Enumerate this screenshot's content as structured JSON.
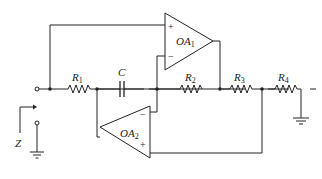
{
  "diagram": {
    "type": "circuit-schematic",
    "components": {
      "R1": {
        "name": "R",
        "sub": "1"
      },
      "C": {
        "name": "C"
      },
      "R2": {
        "name": "R",
        "sub": "2"
      },
      "R3": {
        "name": "R",
        "sub": "3"
      },
      "R4": {
        "name": "R",
        "sub": "4"
      },
      "OA1": {
        "name": "OA",
        "sub": "1",
        "plus": "+",
        "minus": "−"
      },
      "OA2": {
        "name": "OA",
        "sub": "2",
        "plus": "+",
        "minus": "−"
      }
    },
    "impedance_label": "Z"
  }
}
